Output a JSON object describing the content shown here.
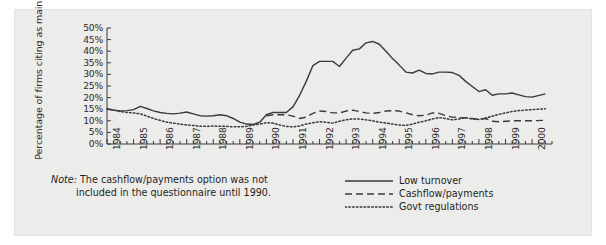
{
  "figure": {
    "background_color": "#ececea",
    "line_color": "#3a3a3a"
  },
  "note": {
    "prefix": "Note:",
    "line1": " The cashflow/payments option was not",
    "line2": "included in the questionnaire until 1990."
  },
  "legend": {
    "position": "bottom-right",
    "items": [
      {
        "label": "Low turnover",
        "style": "solid",
        "name": "low-turnover"
      },
      {
        "label": "Cashflow/payments",
        "style": "dashed",
        "name": "cashflow-payments"
      },
      {
        "label": "Govt regulations",
        "style": "dotted",
        "name": "govt-regulations"
      }
    ]
  },
  "chart_data": {
    "type": "line",
    "title": "",
    "xlabel": "",
    "ylabel": "Percentage of firms citing as main problem",
    "ylim": [
      0,
      50
    ],
    "yticks": [
      0,
      5,
      10,
      15,
      20,
      25,
      30,
      35,
      40,
      45,
      50
    ],
    "ytick_labels": [
      "0%",
      "5%",
      "10%",
      "15%",
      "20%",
      "25%",
      "30%",
      "35%",
      "40%",
      "45%",
      "50%"
    ],
    "xlim": [
      1984,
      2000.75
    ],
    "xticks": [
      1984,
      1985,
      1986,
      1987,
      1988,
      1989,
      1990,
      1991,
      1992,
      1993,
      1994,
      1995,
      1996,
      1997,
      1998,
      1999,
      2000
    ],
    "xtick_labels": [
      "1984",
      "1985",
      "1986",
      "1987",
      "1988",
      "1989",
      "1990",
      "1991",
      "1992",
      "1993",
      "1994",
      "1995",
      "1996",
      "1997",
      "1998",
      "1999",
      "2000"
    ],
    "minor_tick_interval": 0.25,
    "grid": false,
    "series": [
      {
        "name": "Low turnover",
        "style": "solid",
        "x": [
          1984,
          1984.25,
          1984.5,
          1984.75,
          1985,
          1985.25,
          1985.5,
          1985.75,
          1986,
          1986.25,
          1986.5,
          1986.75,
          1987,
          1987.25,
          1987.5,
          1987.75,
          1988,
          1988.25,
          1988.5,
          1988.75,
          1989,
          1989.25,
          1989.5,
          1989.75,
          1990,
          1990.25,
          1990.5,
          1990.75,
          1991,
          1991.25,
          1991.5,
          1991.75,
          1992,
          1992.25,
          1992.5,
          1992.75,
          1993,
          1993.25,
          1993.5,
          1993.75,
          1994,
          1994.25,
          1994.5,
          1994.75,
          1995,
          1995.25,
          1995.5,
          1995.75,
          1996,
          1996.25,
          1996.5,
          1996.75,
          1997,
          1997.25,
          1997.5,
          1997.75,
          1998,
          1998.25,
          1998.5,
          1998.75,
          1999,
          1999.25,
          1999.5,
          1999.75,
          2000,
          2000.5
        ],
        "values": [
          15.0,
          14.6,
          14.2,
          14.4,
          14.8,
          16.2,
          15.3,
          14.3,
          13.6,
          13.2,
          13.0,
          13.3,
          13.8,
          13.0,
          12.2,
          12.0,
          12.2,
          12.6,
          12.2,
          11.0,
          9.4,
          8.6,
          8.4,
          9.4,
          12.6,
          13.6,
          13.6,
          13.6,
          16.0,
          21.0,
          27.0,
          33.8,
          35.6,
          35.6,
          35.6,
          33.4,
          37.0,
          40.4,
          41.0,
          43.6,
          44.2,
          43.0,
          40.0,
          36.8,
          34.0,
          31.0,
          30.6,
          31.8,
          30.4,
          30.2,
          31.0,
          31.0,
          30.8,
          29.6,
          27.0,
          24.8,
          22.6,
          23.4,
          21.0,
          21.6,
          21.6,
          22.0,
          21.2,
          20.4,
          20.2,
          21.6
        ]
      },
      {
        "name": "Cashflow/payments",
        "style": "dashed",
        "x": [
          1990,
          1990.25,
          1990.5,
          1990.75,
          1991,
          1991.25,
          1991.5,
          1991.75,
          1992,
          1992.25,
          1992.5,
          1992.75,
          1993,
          1993.25,
          1993.5,
          1993.75,
          1994,
          1994.25,
          1994.5,
          1994.75,
          1995,
          1995.25,
          1995.5,
          1995.75,
          1996,
          1996.25,
          1996.5,
          1996.75,
          1997,
          1997.25,
          1997.5,
          1997.75,
          1998,
          1998.25,
          1998.5,
          1998.75,
          1999,
          1999.25,
          1999.5,
          1999.75,
          2000,
          2000.5
        ],
        "values": [
          12.2,
          12.6,
          12.6,
          12.6,
          12.0,
          11.0,
          11.6,
          13.2,
          14.2,
          14.0,
          13.4,
          13.4,
          14.2,
          14.6,
          14.0,
          13.4,
          13.2,
          13.6,
          14.2,
          14.4,
          14.2,
          13.4,
          12.6,
          12.2,
          12.4,
          13.4,
          13.2,
          12.2,
          11.6,
          11.4,
          11.2,
          11.0,
          10.6,
          11.0,
          9.8,
          9.6,
          9.8,
          10.0,
          10.0,
          10.0,
          10.0,
          10.2
        ]
      },
      {
        "name": "Govt regulations",
        "style": "dotted",
        "x": [
          1984,
          1984.25,
          1984.5,
          1984.75,
          1985,
          1985.25,
          1985.5,
          1985.75,
          1986,
          1986.25,
          1986.5,
          1986.75,
          1987,
          1987.25,
          1987.5,
          1987.75,
          1988,
          1988.25,
          1988.5,
          1988.75,
          1989,
          1989.25,
          1989.5,
          1989.75,
          1990,
          1990.25,
          1990.5,
          1990.75,
          1991,
          1991.25,
          1991.5,
          1991.75,
          1992,
          1992.25,
          1992.5,
          1992.75,
          1993,
          1993.25,
          1993.5,
          1993.75,
          1994,
          1994.25,
          1994.5,
          1994.75,
          1995,
          1995.25,
          1995.5,
          1995.75,
          1996,
          1996.25,
          1996.5,
          1996.75,
          1997,
          1997.25,
          1997.5,
          1997.75,
          1998,
          1998.25,
          1998.5,
          1998.75,
          1999,
          1999.25,
          1999.5,
          1999.75,
          2000,
          2000.5
        ],
        "values": [
          15.2,
          14.6,
          14.0,
          13.6,
          13.4,
          13.0,
          12.0,
          11.0,
          10.2,
          9.4,
          9.0,
          8.6,
          8.2,
          8.0,
          7.6,
          7.6,
          7.8,
          7.6,
          7.6,
          7.4,
          7.4,
          7.6,
          8.2,
          8.6,
          9.2,
          9.0,
          8.2,
          7.6,
          7.4,
          7.8,
          8.6,
          9.2,
          9.6,
          9.4,
          9.0,
          9.8,
          10.4,
          10.8,
          10.8,
          10.4,
          10.0,
          9.4,
          9.0,
          8.6,
          8.2,
          8.0,
          8.6,
          9.4,
          10.0,
          10.8,
          11.4,
          11.0,
          10.4,
          10.8,
          11.4,
          10.8,
          10.6,
          11.2,
          12.0,
          12.8,
          13.4,
          14.0,
          14.4,
          14.6,
          14.8,
          15.2
        ]
      }
    ]
  }
}
